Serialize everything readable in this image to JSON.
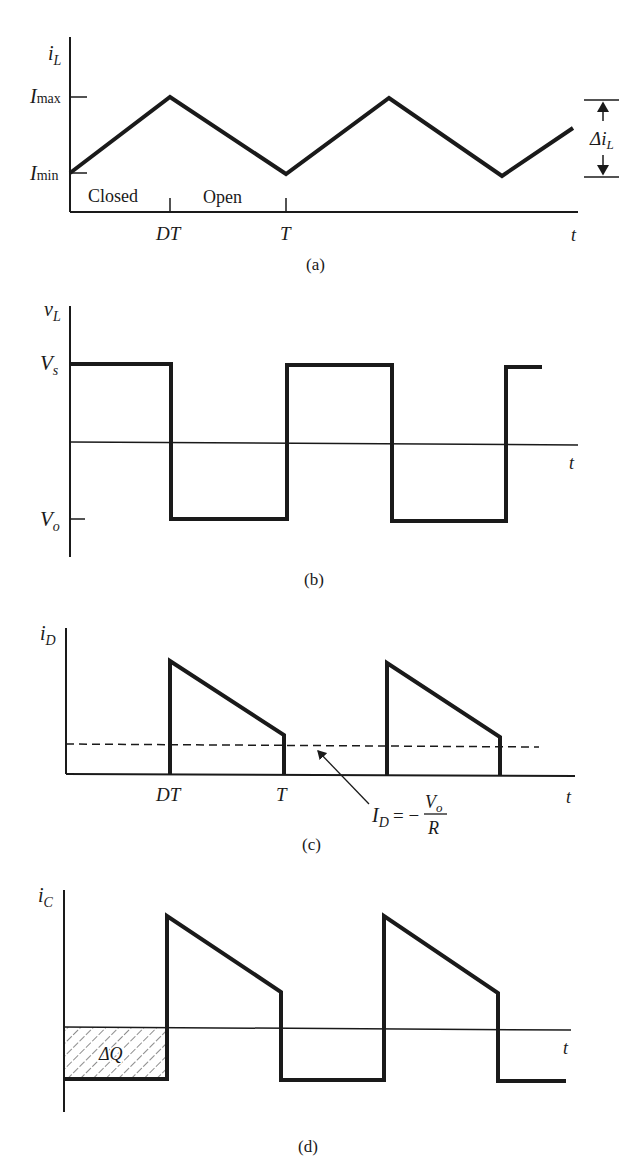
{
  "figure": {
    "panel_a": {
      "caption": "(a)",
      "y_label_main": "i",
      "y_label_sub": "L",
      "ticks": {
        "imax_main": "I",
        "imax_sub": "max",
        "imin_main": "I",
        "imin_sub": "min"
      },
      "x_ticks": [
        "DT",
        "T"
      ],
      "x_label": "t",
      "region_labels": [
        "Closed",
        "Open"
      ],
      "ripple_label_main": "Δi",
      "ripple_label_sub": "L"
    },
    "panel_b": {
      "caption": "(b)",
      "y_label_main": "v",
      "y_label_sub": "L",
      "vs_main": "V",
      "vs_sub": "s",
      "vo_main": "V",
      "vo_sub": "o",
      "x_label": "t"
    },
    "panel_c": {
      "caption": "(c)",
      "y_label_main": "i",
      "y_label_sub": "D",
      "x_ticks": [
        "DT",
        "T"
      ],
      "x_label": "t",
      "annotation_lhs_main": "I",
      "annotation_lhs_sub": "D",
      "annotation_eq": "= −",
      "annotation_num_main": "V",
      "annotation_num_sub": "o",
      "annotation_den": "R"
    },
    "panel_d": {
      "caption": "(d)",
      "y_label_main": "i",
      "y_label_sub": "C",
      "x_label": "t",
      "area_label": "ΔQ"
    }
  },
  "colors": {
    "ink": "#1a1a1a",
    "background": "#ffffff"
  }
}
